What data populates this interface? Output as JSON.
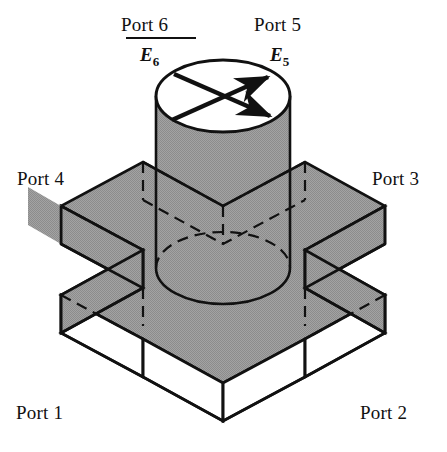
{
  "figure": {
    "background_color": "#ffffff",
    "line_color": "#111111",
    "shade_color": "#9a9a9a",
    "open_face_color": "#ffffff"
  },
  "labels": {
    "port1": "Port 1",
    "port2": "Port 2",
    "port3": "Port 3",
    "port4": "Port 4",
    "port5": "Port 5",
    "port6": "Port 6",
    "e5": "E",
    "e5_sub": "5",
    "e6": "E",
    "e6_sub": "6"
  },
  "geometry": {
    "slab": {
      "top_face_points": "143,162 223,206 305,162 385,206 305,250 385,295 305,339 223,383 143,339 61,295 143,250 61,206",
      "thickness_px": 38
    },
    "cylinder": {
      "top_ellipse": {
        "cx": 223,
        "cy": 96,
        "rx": 67,
        "ry": 36
      },
      "base_ellipse": {
        "cx": 223,
        "cy": 268,
        "rx": 67,
        "ry": 36
      },
      "left_x": 156,
      "right_x": 290
    },
    "arrows": [
      {
        "name": "arrow-up-right",
        "x1": 172,
        "y1": 120,
        "x2": 272,
        "y2": 76
      },
      {
        "name": "arrow-down-right",
        "x1": 174,
        "y1": 75,
        "x2": 274,
        "y2": 118
      }
    ]
  }
}
